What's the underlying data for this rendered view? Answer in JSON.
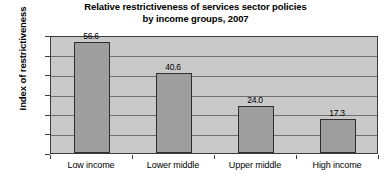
{
  "chart_data": {
    "type": "bar",
    "title": "Relative restrictiveness of services sector policies by income groups, 2007",
    "title_lines": [
      "Relative restrictiveness of services sector policies",
      "by income groups, 2007"
    ],
    "xlabel": "",
    "ylabel": "Index of restrictiveness",
    "categories": [
      "Low income",
      "Lower middle",
      "Upper middle",
      "High income"
    ],
    "values": [
      56.6,
      40.6,
      24.0,
      17.3
    ],
    "value_labels": [
      "56.6",
      "40.6",
      "24.0",
      "17.3"
    ],
    "ylim": [
      0.0,
      60.0
    ],
    "ytick_values": [
      60.0,
      50.0,
      40.0,
      30.0,
      20.0,
      10.0,
      0.0
    ],
    "ytick_labels": [
      "60.0",
      "50.0",
      "40.0",
      "30.0",
      "20.0",
      "10.0",
      "0.0"
    ],
    "grid": true,
    "legend": "none",
    "bar_color": "#9e9e9e",
    "bar_border_color": "#2e2e2e",
    "plot_background_color": "#c9c9c9",
    "gridline_color": "#6e6e6e",
    "axis_color": "#3c3c3c",
    "page_background_color": "#ffffff",
    "text_color": "#000000"
  }
}
